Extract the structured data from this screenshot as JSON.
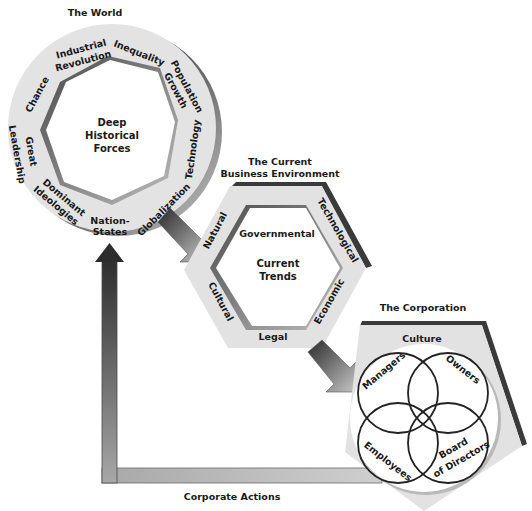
{
  "diagram": {
    "world": {
      "title": "The World",
      "center_label_lines": [
        "Deep",
        "Historical",
        "Forces"
      ],
      "forces": {
        "industrial_revolution": [
          "Industrial",
          "Revolution"
        ],
        "inequality": "Inequality",
        "population_growth": [
          "Population",
          "Growth"
        ],
        "technology": "Technology",
        "globalization": "Globalization",
        "nation_states": [
          "Nation-",
          "States"
        ],
        "dominant_ideologies": [
          "Dominant",
          "Ideologies"
        ],
        "great_leadership": [
          "Great",
          "Leadership"
        ],
        "chance": "Chance"
      }
    },
    "business_environment": {
      "title_lines": [
        "The Current",
        "Business Environment"
      ],
      "center_label_lines": [
        "Current",
        "Trends"
      ],
      "factors": {
        "governmental": "Governmental",
        "technological": "Technological",
        "economic": "Economic",
        "legal": "Legal",
        "cultural": "Cultural",
        "natural": "Natural"
      }
    },
    "corporation": {
      "title": "The Corporation",
      "culture_label": "Culture",
      "stakeholders": {
        "managers": "Managers",
        "owners": "Owners",
        "employees": "Employees",
        "board_lines": [
          "Board",
          "of Directors"
        ]
      }
    },
    "feedback": {
      "label": "Corporate Actions"
    },
    "colors": {
      "ring_fill": "#e2e2e2",
      "shadow_dark": "#3a3a3a",
      "shadow_mid": "#8a8a8a",
      "arrow_dark": "#2e2e2e",
      "arrow_light": "#c8c8c8",
      "text": "#1a1a1a"
    }
  }
}
